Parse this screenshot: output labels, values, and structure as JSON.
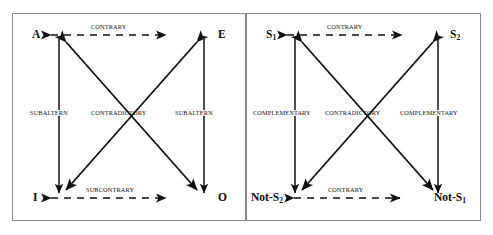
{
  "figure": {
    "type": "logic-diagram-pair"
  },
  "left_diagram": {
    "name": "traditional-square-of-opposition",
    "vertices": {
      "top_left": "A",
      "top_right": "E",
      "bottom_left": "I",
      "bottom_right": "O"
    },
    "relations": {
      "top": "CONTRARY",
      "bottom": "SUBCONTRARY",
      "left_side": "SUBALTERN",
      "right_side": "SUBALTERN",
      "diagonal": "CONTRADICTORY"
    }
  },
  "right_diagram": {
    "name": "semiotic-square",
    "vertices": {
      "top_left": "S",
      "top_left_sub": "1",
      "top_right": "S",
      "top_right_sub": "2",
      "bottom_left": "Not-S",
      "bottom_left_sub": "2",
      "bottom_right": "Not-S",
      "bottom_right_sub": "1"
    },
    "relations": {
      "top": "CONTRARY",
      "bottom": "CONTRARY",
      "left_side": "COMPLEMENTARY",
      "right_side": "COMPLEMENTARY",
      "diagonal": "CONTRADICTORY"
    }
  },
  "colors": {
    "line": "#111111",
    "frame": "#8a8a8a",
    "background": "#ffffff",
    "text": "#0b0b0b"
  }
}
